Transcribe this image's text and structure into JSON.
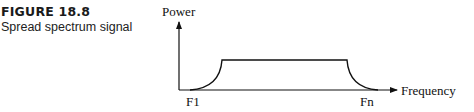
{
  "figure": {
    "number": "FIGURE 18.8",
    "caption": "Spread spectrum signal"
  },
  "diagram": {
    "y_axis_label": "Power",
    "x_axis_label": "Frequency",
    "x_start_label": "F1",
    "x_end_label": "Fn",
    "line_color": "#111111"
  }
}
